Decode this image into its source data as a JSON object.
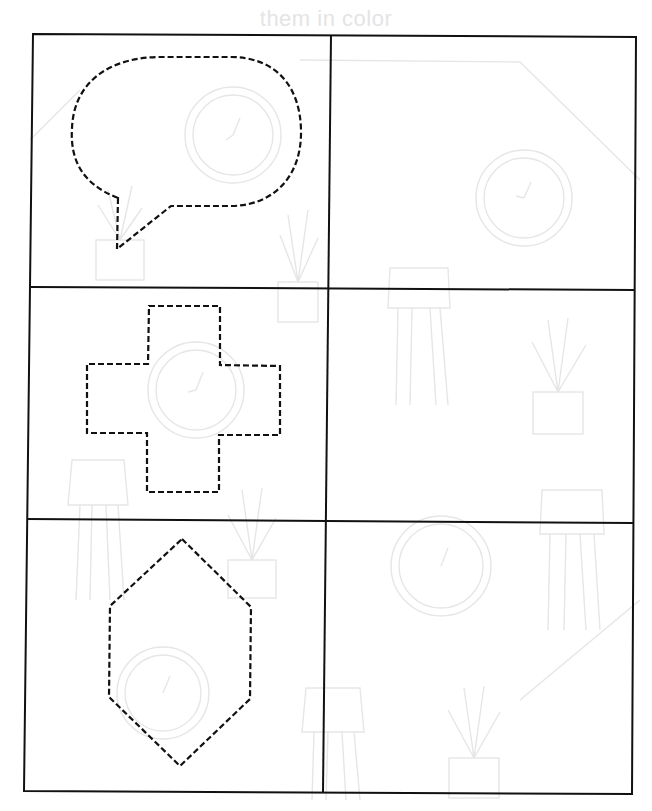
{
  "header": {
    "text": "them in color"
  },
  "colors": {
    "grid_line": "#111111",
    "dashed_outline": "#111111",
    "ghost_artwork": "#e6e6e6",
    "header_text": "#e4e4e4",
    "background": "#ffffff"
  },
  "worksheet": {
    "layout": {
      "rows": 3,
      "columns": 2
    },
    "cells": [
      {
        "row": 1,
        "column": 1,
        "shape": "speech-bubble",
        "style": "dashed-outline",
        "purpose": "trace"
      },
      {
        "row": 1,
        "column": 2,
        "shape": "none",
        "purpose": "draw"
      },
      {
        "row": 2,
        "column": 1,
        "shape": "cross",
        "style": "dashed-outline",
        "purpose": "trace"
      },
      {
        "row": 2,
        "column": 2,
        "shape": "none",
        "purpose": "draw"
      },
      {
        "row": 3,
        "column": 1,
        "shape": "hexagon",
        "style": "dashed-outline",
        "purpose": "trace"
      },
      {
        "row": 3,
        "column": 2,
        "shape": "none",
        "purpose": "draw"
      }
    ]
  },
  "background_artwork": {
    "items": [
      "wall-clock",
      "potted-plant",
      "floor-lamp",
      "wall-clock",
      "potted-plant",
      "floor-lamp",
      "wall-clock",
      "potted-plant",
      "floor-lamp"
    ]
  }
}
